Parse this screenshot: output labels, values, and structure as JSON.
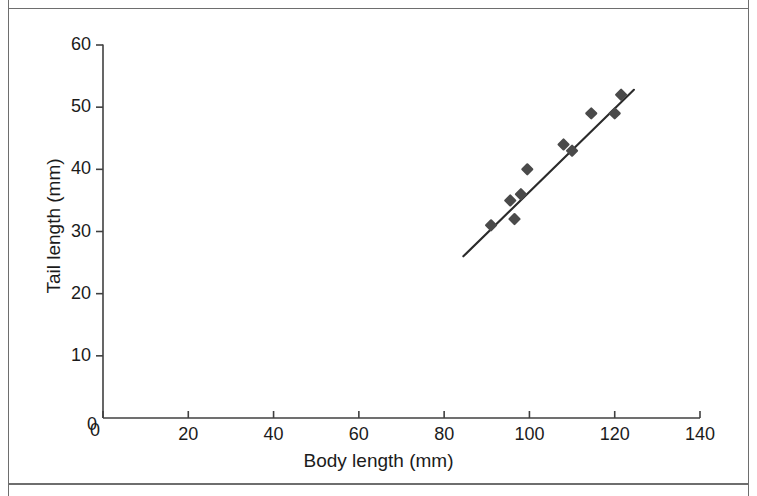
{
  "figure": {
    "background_color": "#ffffff",
    "frame_color": "#6e6e6e",
    "axis_color": "#404040",
    "marker_color": "#4a4a4a",
    "line_color": "#2b2b2b",
    "text_color": "#1b1b1b"
  },
  "chart_data": {
    "type": "scatter",
    "title": "",
    "xlabel": "Body length (mm)",
    "ylabel": "Tail length (mm)",
    "xlim": [
      0,
      140
    ],
    "ylim": [
      0,
      60
    ],
    "xticks": [
      0,
      20,
      40,
      60,
      80,
      100,
      120,
      140
    ],
    "yticks": [
      0,
      10,
      20,
      30,
      40,
      50,
      60
    ],
    "xtick_labels": [
      "0",
      "20",
      "40",
      "60",
      "80",
      "100",
      "120",
      "140"
    ],
    "ytick_labels": [
      "0",
      "10",
      "20",
      "30",
      "40",
      "50",
      "60"
    ],
    "grid": false,
    "legend": false,
    "legend_position": "none",
    "marker": "diamond",
    "series": [
      {
        "name": "observations",
        "x": [
          91,
          95.5,
          96.5,
          98,
          99.5,
          108,
          110,
          114.5,
          120,
          121.5
        ],
        "y": [
          31,
          35,
          32,
          36,
          40,
          44,
          43,
          49,
          49,
          52
        ]
      }
    ],
    "trendline": {
      "name": "linear fit",
      "x": [
        84.5,
        124.5
      ],
      "y": [
        26,
        52.8
      ],
      "style": "solid"
    }
  }
}
